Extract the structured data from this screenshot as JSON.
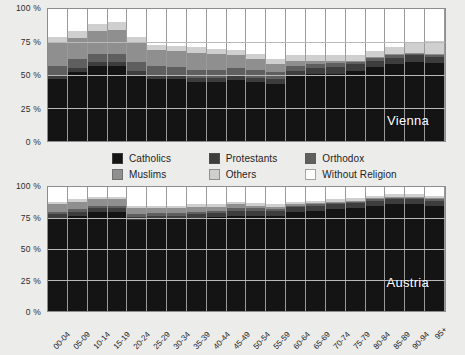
{
  "chart_data": {
    "type": "bar",
    "title": "",
    "stacked": true,
    "stack_mode": "percent",
    "xlabel": "",
    "ylabel": "",
    "ylim": [
      0,
      100
    ],
    "ytick_labels": [
      "0 %",
      "25 %",
      "50 %",
      "75 %",
      "100 %"
    ],
    "ytick_values": [
      0,
      25,
      50,
      75,
      100
    ],
    "grid": true,
    "legend_position": "between-panels",
    "categories": [
      "00-04",
      "05-09",
      "10-14",
      "15-19",
      "20-24",
      "25-29",
      "30-34",
      "35-39",
      "40-44",
      "45-49",
      "50-54",
      "55-59",
      "60-64",
      "65-69",
      "70-74",
      "75-79",
      "80-84",
      "85-89",
      "90-94",
      "95+"
    ],
    "series_order": [
      "Catholics",
      "Protestants",
      "Orthodox",
      "Muslims",
      "Others",
      "Without Religion"
    ],
    "colors": {
      "Catholics": "#141414",
      "Protestants": "#3d3d3d",
      "Orthodox": "#5f5f5f",
      "Muslims": "#8f8f8f",
      "Others": "#cfcfcf",
      "Without Religion": "#ffffff"
    },
    "panels": [
      {
        "name": "Vienna",
        "label": "Vienna",
        "series": [
          {
            "name": "Catholics",
            "values": [
              47,
              52,
              57,
              57,
              50,
              47,
              47,
              45,
              45,
              46,
              45,
              43,
              49,
              51,
              51,
              53,
              56,
              58,
              60,
              59
            ]
          },
          {
            "name": "Protestants",
            "values": [
              3,
              3,
              3,
              3,
              3,
              3,
              3,
              3,
              3,
              3,
              3,
              4,
              4,
              4,
              5,
              5,
              5,
              5,
              5,
              5
            ]
          },
          {
            "name": "Orthodox",
            "values": [
              7,
              7,
              6,
              6,
              7,
              7,
              6,
              6,
              6,
              6,
              6,
              5,
              4,
              3,
              3,
              2,
              2,
              2,
              1,
              1
            ]
          },
          {
            "name": "Muslims",
            "values": [
              18,
              16,
              17,
              18,
              14,
              12,
              12,
              13,
              12,
              10,
              8,
              6,
              4,
              3,
              2,
              1,
              1,
              1,
              1,
              1
            ]
          },
          {
            "name": "Others",
            "values": [
              4,
              5,
              6,
              6,
              5,
              4,
              4,
              4,
              4,
              4,
              4,
              4,
              4,
              4,
              4,
              4,
              4,
              5,
              8,
              10
            ]
          },
          {
            "name": "Without Religion",
            "values": [
              21,
              17,
              11,
              10,
              21,
              27,
              28,
              29,
              30,
              31,
              34,
              38,
              35,
              35,
              35,
              35,
              32,
              29,
              25,
              24
            ]
          }
        ]
      },
      {
        "name": "Austria",
        "label": "Austria",
        "series": [
          {
            "name": "Catholics",
            "values": [
              75,
              77,
              80,
              80,
              73,
              74,
              74,
              75,
              76,
              77,
              77,
              77,
              80,
              81,
              82,
              83,
              85,
              86,
              86,
              85
            ]
          },
          {
            "name": "Protestants",
            "values": [
              3,
              3,
              3,
              3,
              3,
              3,
              3,
              3,
              3,
              4,
              4,
              4,
              4,
              4,
              4,
              4,
              4,
              4,
              4,
              4
            ]
          },
          {
            "name": "Orthodox",
            "values": [
              2,
              2,
              2,
              2,
              2,
              2,
              2,
              2,
              2,
              2,
              2,
              1,
              1,
              1,
              1,
              1,
              1,
              1,
              1,
              1
            ]
          },
          {
            "name": "Muslims",
            "values": [
              6,
              6,
              5,
              5,
              5,
              4,
              4,
              4,
              3,
              3,
              2,
              2,
              1,
              1,
              1,
              1,
              1,
              1,
              1,
              1
            ]
          },
          {
            "name": "Others",
            "values": [
              2,
              2,
              2,
              2,
              2,
              2,
              2,
              2,
              2,
              2,
              2,
              2,
              2,
              2,
              2,
              2,
              2,
              2,
              2,
              2
            ]
          },
          {
            "name": "Without Religion",
            "values": [
              12,
              10,
              8,
              8,
              15,
              15,
              15,
              14,
              14,
              12,
              13,
              14,
              12,
              11,
              10,
              9,
              7,
              6,
              6,
              7
            ]
          }
        ]
      }
    ]
  },
  "legend": {
    "items": [
      {
        "label": "Catholics",
        "color": "#141414"
      },
      {
        "label": "Protestants",
        "color": "#3d3d3d"
      },
      {
        "label": "Orthodox",
        "color": "#5f5f5f"
      },
      {
        "label": "Muslims",
        "color": "#8f8f8f"
      },
      {
        "label": "Others",
        "color": "#cfcfcf"
      },
      {
        "label": "Without Religion",
        "color": "#ffffff"
      }
    ]
  }
}
